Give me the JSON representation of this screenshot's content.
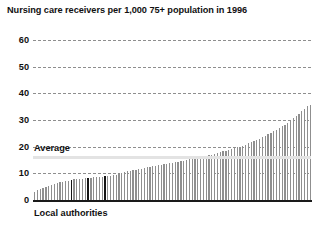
{
  "chart_data": {
    "type": "bar",
    "title": "Nursing care receivers per 1,000 75+ population in 1996",
    "xlabel": "Local authorities",
    "ylabel": "",
    "ylim": [
      0,
      60
    ],
    "yticks": [
      0,
      10,
      20,
      30,
      40,
      50,
      60
    ],
    "ytick_labels": [
      "0",
      "10",
      "20",
      "30",
      "40",
      "50",
      "60"
    ],
    "grid": true,
    "legend": "none",
    "bar_color": "#8f8f8f",
    "highlight_color": "#141414",
    "gridline_color": "#8e8e8e",
    "average_line_color": "#e3e3e3",
    "annotations": [
      {
        "label": "Average",
        "value": 16.5
      }
    ],
    "categories_note": "Local authorities sorted ascending by rate (unlabeled)",
    "highlighted_indices": [
      13,
      19,
      25
    ],
    "values": [
      3.0,
      3.6,
      4.0,
      4.4,
      4.8,
      5.2,
      5.6,
      6.0,
      6.3,
      6.6,
      6.9,
      7.1,
      7.3,
      7.6,
      7.7,
      7.8,
      7.9,
      8.0,
      8.1,
      8.3,
      8.4,
      8.5,
      8.6,
      8.7,
      8.8,
      8.9,
      9.0,
      9.1,
      9.3,
      9.5,
      9.8,
      10.1,
      10.4,
      10.7,
      11.0,
      11.2,
      11.4,
      11.6,
      11.8,
      12.0,
      12.2,
      12.4,
      12.6,
      12.8,
      13.0,
      13.2,
      13.4,
      13.6,
      13.8,
      14.0,
      14.2,
      14.4,
      14.6,
      14.8,
      15.0,
      15.2,
      15.5,
      15.8,
      16.0,
      16.2,
      16.4,
      16.6,
      16.8,
      17.0,
      17.3,
      17.6,
      17.9,
      18.2,
      18.5,
      18.8,
      19.1,
      19.4,
      19.7,
      20.0,
      20.4,
      20.8,
      21.2,
      21.6,
      22.0,
      22.5,
      23.0,
      23.5,
      24.0,
      24.6,
      25.2,
      25.8,
      26.4,
      27.0,
      27.6,
      28.3,
      29.0,
      29.8,
      30.6,
      31.4,
      32.3,
      33.2,
      34.2,
      35.2,
      35.8
    ]
  }
}
